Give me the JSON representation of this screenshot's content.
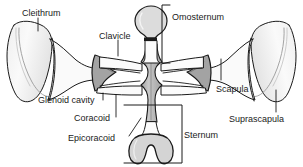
{
  "figure": {
    "type": "labeled-anatomical-diagram",
    "background_color": "#ffffff",
    "outline_color": "#1a1a1a",
    "bone_fill_light": "#f2f2f2",
    "bone_fill_mid": "#d9d9d9",
    "bone_fill_dark": "#a8a8a8",
    "leader_color": "#1a1a1a"
  },
  "labels": [
    {
      "id": "cleithrum",
      "text": "Cleithrum",
      "x": 22,
      "y": 8
    },
    {
      "id": "clavicle",
      "text": "Clavicle",
      "x": 99,
      "y": 31
    },
    {
      "id": "omosternum",
      "text": "Omosternum",
      "x": 172,
      "y": 12
    },
    {
      "id": "scapula",
      "text": "Scapula",
      "x": 216,
      "y": 84
    },
    {
      "id": "suprascapula",
      "text": "Suprascapula",
      "x": 229,
      "y": 114
    },
    {
      "id": "glenoid-cavity",
      "text": "Glenoid cavity",
      "x": 38,
      "y": 95
    },
    {
      "id": "coracoid",
      "text": "Coracoid",
      "x": 74,
      "y": 113
    },
    {
      "id": "epicoracoid",
      "text": "Epicoracoid",
      "x": 68,
      "y": 133
    },
    {
      "id": "sternum",
      "text": "Sternum",
      "x": 184,
      "y": 130
    }
  ],
  "structures": [
    {
      "id": "left-suprascapula",
      "name": "left suprascapula (fan-shaped blade)"
    },
    {
      "id": "right-suprascapula",
      "name": "right suprascapula (fan-shaped blade)"
    },
    {
      "id": "left-scapula",
      "name": "left scapula (narrow neck)"
    },
    {
      "id": "right-scapula",
      "name": "right scapula (narrow neck)"
    },
    {
      "id": "left-glenoid-cavity",
      "name": "left glenoid cavity (dark shaded socket)"
    },
    {
      "id": "right-glenoid-cavity",
      "name": "right glenoid cavity (dark shaded socket)"
    },
    {
      "id": "left-clavicle",
      "name": "left clavicle (anterior bar)"
    },
    {
      "id": "right-clavicle",
      "name": "right clavicle (anterior bar)"
    },
    {
      "id": "left-coracoid",
      "name": "left coracoid (posterior bar)"
    },
    {
      "id": "right-coracoid",
      "name": "right coracoid (posterior bar)"
    },
    {
      "id": "epicoracoid-column",
      "name": "epicoracoid (median shaded column)"
    },
    {
      "id": "omosternum-body",
      "name": "omosternum (anterior club-shaped element)"
    },
    {
      "id": "sternum-body",
      "name": "sternum (posterior notched plate)"
    }
  ]
}
